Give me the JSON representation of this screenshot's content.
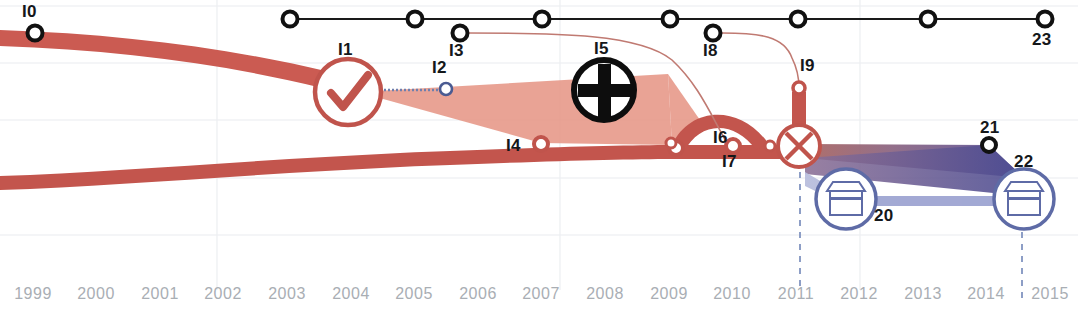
{
  "chart_data": {
    "type": "area",
    "title": "",
    "subtitle": "",
    "xlabel": "",
    "ylabel": "",
    "grid": true,
    "legend_position": "none",
    "x_axis": {
      "tick_labels": [
        "1999",
        "2000",
        "2001",
        "2002",
        "2003",
        "2004",
        "2005",
        "2006",
        "2007",
        "2008",
        "2009",
        "2010",
        "2011",
        "2012",
        "2013",
        "2014",
        "2015"
      ],
      "range": [
        1999,
        2015
      ],
      "tick_px": [
        33,
        96,
        160,
        223,
        287,
        351,
        414,
        478,
        541,
        605,
        669,
        732,
        796,
        859,
        923,
        986,
        1050
      ]
    },
    "y_gridlines_px": [
      6,
      63,
      120,
      178,
      235
    ],
    "dashed_verticals_px": [
      800,
      1022
    ],
    "vertical_gridlines_px": [
      217,
      560,
      860
    ],
    "series": [
      {
        "name": "upper-red-band",
        "color": "#cb5b52",
        "description": "thick red band descending from upper left toward centre"
      },
      {
        "name": "lower-red-band",
        "color": "#c3554d",
        "description": "thick red band along lower area rising slightly toward 2009"
      },
      {
        "name": "salmon-wedge",
        "color": "#e59382",
        "description": "translucent salmon polygon spanning 2004-2009"
      },
      {
        "name": "purple-wedge-upper",
        "color": "#7b5f84",
        "description": "dark red-to-purple gradient band from 2011 to 2014"
      },
      {
        "name": "purple-wedge-lower",
        "color": "#9ba3d0",
        "description": "light periwinkle band from 2011 to 2014"
      }
    ],
    "top_track": {
      "line_color": "#1a1a1a",
      "y_px": 19,
      "nodes_px": [
        290,
        415,
        542,
        670,
        798,
        928,
        1045
      ]
    },
    "annotations": [
      {
        "id": "I0",
        "label": "I0",
        "x": 35,
        "y": 33,
        "marker": "black-ring",
        "label_dx": -8,
        "label_dy": -28
      },
      {
        "id": "I1",
        "label": "I1",
        "x": 348,
        "y": 92,
        "marker": "check-circle",
        "label_dx": -6,
        "label_dy": -48
      },
      {
        "id": "I2",
        "label": "I2",
        "x": 446,
        "y": 88,
        "marker": "blue-ring-small",
        "label_dx": -6,
        "label_dy": -32
      },
      {
        "id": "I3",
        "label": "I3",
        "x": 460,
        "y": 33,
        "marker": "black-ring",
        "label_dx": -6,
        "label_dy": 7
      },
      {
        "id": "I4",
        "label": "I4",
        "x": 541,
        "y": 144,
        "marker": "red-ring",
        "label_dx": -32,
        "label_dy": 3
      },
      {
        "id": "I5",
        "label": "I5",
        "x": 604,
        "y": 90,
        "marker": "plus-circle",
        "label_dx": -6,
        "label_dy": -48
      },
      {
        "id": "I6",
        "label": "I6",
        "x": 700,
        "y": 115,
        "marker": "none",
        "label_dx": 18,
        "label_dy": -6
      },
      {
        "id": "I7",
        "label": "I7",
        "x": 733,
        "y": 145,
        "marker": "red-ring",
        "label_dx": -6,
        "label_dy": 7
      },
      {
        "id": "I8",
        "label": "I8",
        "x": 712,
        "y": 33,
        "marker": "black-ring",
        "label_dx": -6,
        "label_dy": 7
      },
      {
        "id": "I9",
        "label": "I9",
        "x": 799,
        "y": 86,
        "marker": "red-ring-small",
        "label_dx": 3,
        "label_dy": -28
      },
      {
        "id": "I20",
        "label": "20",
        "x": 846,
        "y": 199,
        "marker": "shop-circle",
        "label_dx": 32,
        "label_dy": 12
      },
      {
        "id": "I21",
        "label": "21",
        "x": 989,
        "y": 145,
        "marker": "black-ring",
        "label_dx": -7,
        "label_dy": -28
      },
      {
        "id": "I22",
        "label": "22",
        "x": 1024,
        "y": 199,
        "marker": "shop-circle",
        "label_dx": -4,
        "label_dy": -42
      },
      {
        "id": "I23",
        "label": "23",
        "x": 1045,
        "y": 19,
        "marker": "black-ring",
        "label_dx": -6,
        "label_dy": 12
      }
    ],
    "colors": {
      "red_band": "#cb5b52",
      "salmon_fill": "#e2917f",
      "thin_red_line": "#c07a72",
      "purple_dark": "#6d5c8c",
      "periwinkle": "#a2a9d4",
      "shop_icon_blue": "#5e6ba6",
      "grid": "#e9ecef",
      "axis_text": "#a9aeb4",
      "node_black": "#15171a"
    }
  },
  "axis": {
    "years": [
      "1999",
      "2000",
      "2001",
      "2002",
      "2003",
      "2004",
      "2005",
      "2006",
      "2007",
      "2008",
      "2009",
      "2010",
      "2011",
      "2012",
      "2013",
      "2014",
      "2015"
    ]
  },
  "labels": {
    "i0": "I0",
    "i1": "I1",
    "i2": "I2",
    "i3": "I3",
    "i4": "I4",
    "i5": "I5",
    "i6": "I6",
    "i7": "I7",
    "i8": "I8",
    "i9": "I9",
    "n20": "20",
    "n21": "21",
    "n22": "22",
    "n23": "23"
  }
}
